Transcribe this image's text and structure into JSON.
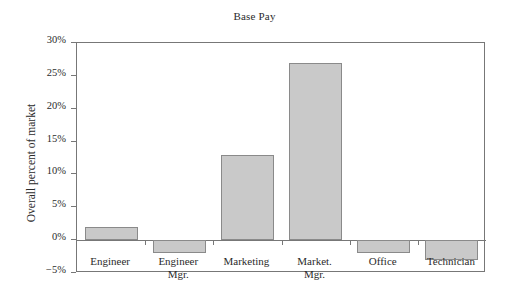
{
  "chart_data": {
    "type": "bar",
    "title": "Base Pay",
    "xlabel": "",
    "ylabel": "Overall percent of market",
    "categories": [
      "Engineer",
      "Engineer Mgr.",
      "Marketing",
      "Market. Mgr.",
      "Office",
      "Technician"
    ],
    "category_lines": [
      {
        "line1": "Engineer",
        "line2": ""
      },
      {
        "line1": "Engineer",
        "line2": "Mgr."
      },
      {
        "line1": "Marketing",
        "line2": ""
      },
      {
        "line1": "Market.",
        "line2": "Mgr."
      },
      {
        "line1": "Office",
        "line2": ""
      },
      {
        "line1": "Technician",
        "line2": ""
      }
    ],
    "values": [
      2,
      -2,
      13,
      27,
      -2,
      -3
    ],
    "ylim": [
      -5,
      30
    ],
    "yticks": [
      30,
      25,
      20,
      15,
      10,
      5,
      0,
      -5
    ],
    "ytick_labels": [
      "30%",
      "25%",
      "20%",
      "15%",
      "10%",
      "5%",
      "0%",
      "-5%"
    ],
    "grid": false,
    "legend": false,
    "bar_fill_color": "#c9c9c9",
    "bar_edge_color": "#8a8a8a",
    "axis_color": "#777777",
    "zero_reference_line": 0
  }
}
